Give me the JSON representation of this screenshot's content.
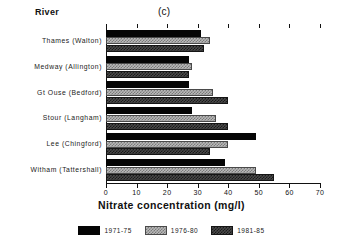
{
  "figure": {
    "panel_label": "(c)",
    "y_axis_name": "River",
    "x_axis_title": "Nitrate concentration (mg/l)"
  },
  "chart_data": {
    "type": "bar",
    "orientation": "horizontal",
    "title": "(c)",
    "xlabel": "Nitrate concentration (mg/l)",
    "ylabel": "River",
    "xlim": [
      0,
      70
    ],
    "xticks": [
      0,
      10,
      20,
      30,
      40,
      50,
      60,
      70
    ],
    "grid": false,
    "legend_position": "bottom",
    "categories": [
      "Thames (Walton)",
      "Medway (Allington)",
      "Gt Ouse (Bedford)",
      "Stour (Langham)",
      "Lee (Chingford)",
      "Witham (Tattershall)"
    ],
    "series": [
      {
        "name": "1971-75",
        "color": "#050505",
        "values": [
          31,
          27,
          27,
          28,
          49,
          39
        ]
      },
      {
        "name": "1976-80",
        "color": "#b9b9b9",
        "values": [
          34,
          28,
          35,
          36,
          40,
          49
        ]
      },
      {
        "name": "1981-85",
        "color": "#4a4a4a",
        "values": [
          32,
          27,
          40,
          40,
          34,
          55
        ]
      }
    ]
  },
  "legend": {
    "items": [
      {
        "label": "1971-75"
      },
      {
        "label": "1976-80"
      },
      {
        "label": "1981-85"
      }
    ]
  },
  "xtick_labels": [
    "0",
    "10",
    "20",
    "30",
    "40",
    "50",
    "60",
    "70"
  ]
}
